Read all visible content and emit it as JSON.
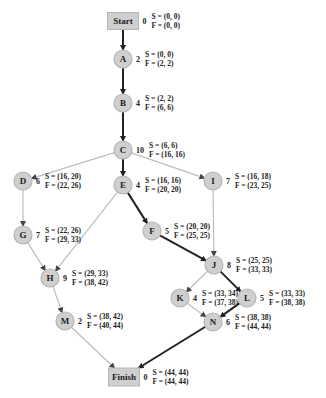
{
  "colors": {
    "node_fill": "#cfcfcf",
    "node_stroke": "#b5b5b5",
    "critical_edge": "#222222",
    "normal_edge": "#bdbdbd",
    "text": "#222222"
  },
  "nodes": [
    {
      "id": "Start",
      "shape": "rect",
      "cx": 123,
      "cy": 21,
      "duration": "0",
      "S": "S = (0, 0)",
      "F": "F = (0, 0)"
    },
    {
      "id": "A",
      "shape": "circle",
      "cx": 123,
      "cy": 59,
      "duration": "2",
      "S": "S = (0, 0)",
      "F": "F = (2, 2)"
    },
    {
      "id": "B",
      "shape": "circle",
      "cx": 123,
      "cy": 103,
      "duration": "4",
      "S": "S = (2, 2)",
      "F": "F = (6, 6)"
    },
    {
      "id": "C",
      "shape": "circle",
      "cx": 123,
      "cy": 150,
      "duration": "10",
      "S": "S = (6, 6)",
      "F": "F = (16, 16)"
    },
    {
      "id": "D",
      "shape": "circle",
      "cx": 23,
      "cy": 181,
      "duration": "6",
      "S": "S = (16, 20)",
      "F": "F = (22, 26)"
    },
    {
      "id": "E",
      "shape": "circle",
      "cx": 123,
      "cy": 185,
      "duration": "4",
      "S": "S = (16, 16)",
      "F": "F = (20, 20)"
    },
    {
      "id": "I",
      "shape": "circle",
      "cx": 213,
      "cy": 181,
      "duration": "7",
      "S": "S = (16, 18)",
      "F": "F = (23, 25)"
    },
    {
      "id": "G",
      "shape": "circle",
      "cx": 23,
      "cy": 235,
      "duration": "7",
      "S": "S = (22, 26)",
      "F": "F = (29, 33)"
    },
    {
      "id": "F",
      "shape": "circle",
      "cx": 152,
      "cy": 231,
      "duration": "5",
      "S": "S = (20, 20)",
      "F": "F = (25, 25)"
    },
    {
      "id": "H",
      "shape": "circle",
      "cx": 50,
      "cy": 278,
      "duration": "9",
      "S": "S = (29, 33)",
      "F": "F = (38, 42)"
    },
    {
      "id": "J",
      "shape": "circle",
      "cx": 214,
      "cy": 265,
      "duration": "8",
      "S": "S = (25, 25)",
      "F": "F = (33, 33)"
    },
    {
      "id": "K",
      "shape": "circle",
      "cx": 180,
      "cy": 298,
      "duration": "4",
      "S": "S = (33, 34)",
      "F": "F = (37, 38)"
    },
    {
      "id": "L",
      "shape": "circle",
      "cx": 247,
      "cy": 298,
      "duration": "5",
      "S": "S = (33, 33)",
      "F": "F = (38, 38)"
    },
    {
      "id": "M",
      "shape": "circle",
      "cx": 65,
      "cy": 321,
      "duration": "2",
      "S": "S = (38, 42)",
      "F": "F = (40, 44)"
    },
    {
      "id": "N",
      "shape": "circle",
      "cx": 213,
      "cy": 322,
      "duration": "6",
      "S": "S = (38, 38)",
      "F": "F = (44, 44)"
    },
    {
      "id": "Finish",
      "shape": "rect",
      "cx": 124,
      "cy": 377,
      "duration": "0",
      "S": "S = (44, 44)",
      "F": "F = (44, 44)"
    }
  ],
  "edges": [
    {
      "from": "Start",
      "to": "A",
      "critical": true
    },
    {
      "from": "A",
      "to": "B",
      "critical": true
    },
    {
      "from": "B",
      "to": "C",
      "critical": true
    },
    {
      "from": "C",
      "to": "D",
      "critical": false
    },
    {
      "from": "C",
      "to": "E",
      "critical": true
    },
    {
      "from": "C",
      "to": "I",
      "critical": false
    },
    {
      "from": "D",
      "to": "G",
      "critical": false
    },
    {
      "from": "E",
      "to": "F",
      "critical": true
    },
    {
      "from": "E",
      "to": "H",
      "critical": false
    },
    {
      "from": "G",
      "to": "H",
      "critical": false
    },
    {
      "from": "F",
      "to": "J",
      "critical": true
    },
    {
      "from": "I",
      "to": "J",
      "critical": false
    },
    {
      "from": "J",
      "to": "K",
      "critical": false
    },
    {
      "from": "J",
      "to": "L",
      "critical": true
    },
    {
      "from": "H",
      "to": "M",
      "critical": false
    },
    {
      "from": "K",
      "to": "N",
      "critical": false
    },
    {
      "from": "L",
      "to": "N",
      "critical": true
    },
    {
      "from": "M",
      "to": "Finish",
      "critical": false
    },
    {
      "from": "N",
      "to": "Finish",
      "critical": true
    }
  ]
}
